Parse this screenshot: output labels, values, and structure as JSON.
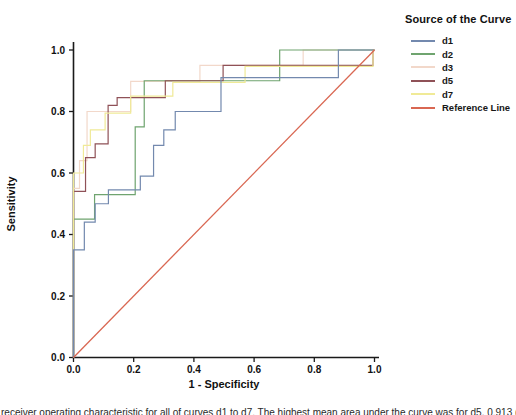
{
  "figure": {
    "caption_fragment": "receiver operating characteristic for all of curves d1 to d7. The highest mean area under the curve was for d5, 0.913 (95% CI 0.9"
  },
  "chart_data": {
    "type": "line",
    "subtype": "roc-step-curves",
    "title": "",
    "xlabel": "1 - Specificity",
    "ylabel": "Sensitivity",
    "xlim": [
      0,
      1
    ],
    "ylim": [
      0,
      1
    ],
    "grid": false,
    "legend_position": "top-right-outside",
    "legend_title": "Source of the Curve",
    "xticks": [
      "0.0",
      "0.2",
      "0.4",
      "0.6",
      "0.8",
      "1.0"
    ],
    "yticks": [
      "0.0",
      "0.2",
      "0.4",
      "0.6",
      "0.8",
      "1.0"
    ],
    "series": [
      {
        "name": "d1",
        "color": "#7389AE",
        "steps": [
          [
            0,
            0.35
          ],
          [
            0.036,
            0.44
          ],
          [
            0.072,
            0.5
          ],
          [
            0.116,
            0.545
          ],
          [
            0.222,
            0.59
          ],
          [
            0.266,
            0.69
          ],
          [
            0.3,
            0.74
          ],
          [
            0.338,
            0.8
          ],
          [
            0.49,
            0.91
          ],
          [
            0.88,
            1.0
          ]
        ]
      },
      {
        "name": "d2",
        "color": "#6FA46F",
        "steps": [
          [
            0,
            0.45
          ],
          [
            0.07,
            0.53
          ],
          [
            0.205,
            0.75
          ],
          [
            0.235,
            0.9
          ],
          [
            0.685,
            1.0
          ]
        ]
      },
      {
        "name": "d3",
        "color": "#F2D8CA",
        "steps": [
          [
            0,
            0.55
          ],
          [
            0.02,
            0.64
          ],
          [
            0.045,
            0.8
          ],
          [
            0.19,
            0.898
          ],
          [
            0.42,
            0.95
          ],
          [
            0.763,
            1.0
          ]
        ]
      },
      {
        "name": "d5",
        "color": "#8F5157",
        "steps": [
          [
            0,
            0.54
          ],
          [
            0.04,
            0.65
          ],
          [
            0.072,
            0.695
          ],
          [
            0.115,
            0.82
          ],
          [
            0.145,
            0.845
          ],
          [
            0.305,
            0.9
          ],
          [
            0.497,
            0.95
          ],
          [
            0.995,
            1.0
          ]
        ]
      },
      {
        "name": "d7",
        "color": "#F0EA97",
        "steps": [
          [
            0,
            0.6
          ],
          [
            0.033,
            0.69
          ],
          [
            0.056,
            0.74
          ],
          [
            0.105,
            0.795
          ],
          [
            0.19,
            0.85
          ],
          [
            0.33,
            0.895
          ],
          [
            0.57,
            0.947
          ],
          [
            0.995,
            1.0
          ]
        ]
      },
      {
        "name": "Reference Line",
        "color": "#D96752",
        "diagonal": true
      }
    ],
    "draw_order": [
      "d3",
      "d2",
      "d5",
      "d7",
      "d1",
      "Reference Line"
    ]
  }
}
